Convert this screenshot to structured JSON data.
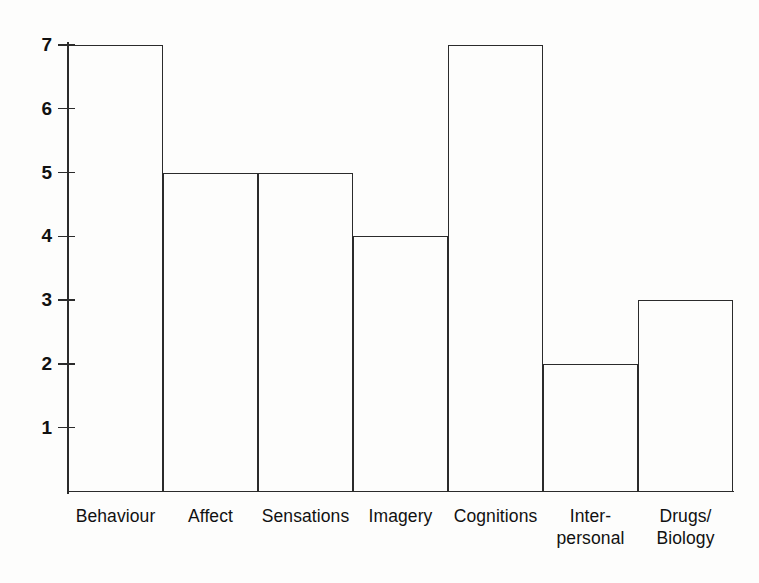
{
  "chart_data": {
    "type": "bar",
    "title": "",
    "subtitle": "",
    "xlabel": "",
    "ylabel": "",
    "categories": [
      "Behaviour",
      "Affect",
      "Sensations",
      "Imagery",
      "Cognitions",
      "Inter-\npersonal",
      "Drugs/\nBiology"
    ],
    "values": [
      7,
      5,
      5,
      4,
      7,
      2,
      3
    ],
    "ylim": [
      0,
      7
    ],
    "yticks": [
      1,
      2,
      3,
      4,
      5,
      6,
      7
    ],
    "ytick_labels": [
      "1",
      "2",
      "3",
      "4",
      "5",
      "6",
      "7"
    ],
    "grid": false,
    "legend": null,
    "bar_style": {
      "fill": "none",
      "outline_color": "#2b2b2b",
      "gap": 0
    },
    "axis_color": "#2b2b2b",
    "background_color": "#fdfdfc"
  }
}
